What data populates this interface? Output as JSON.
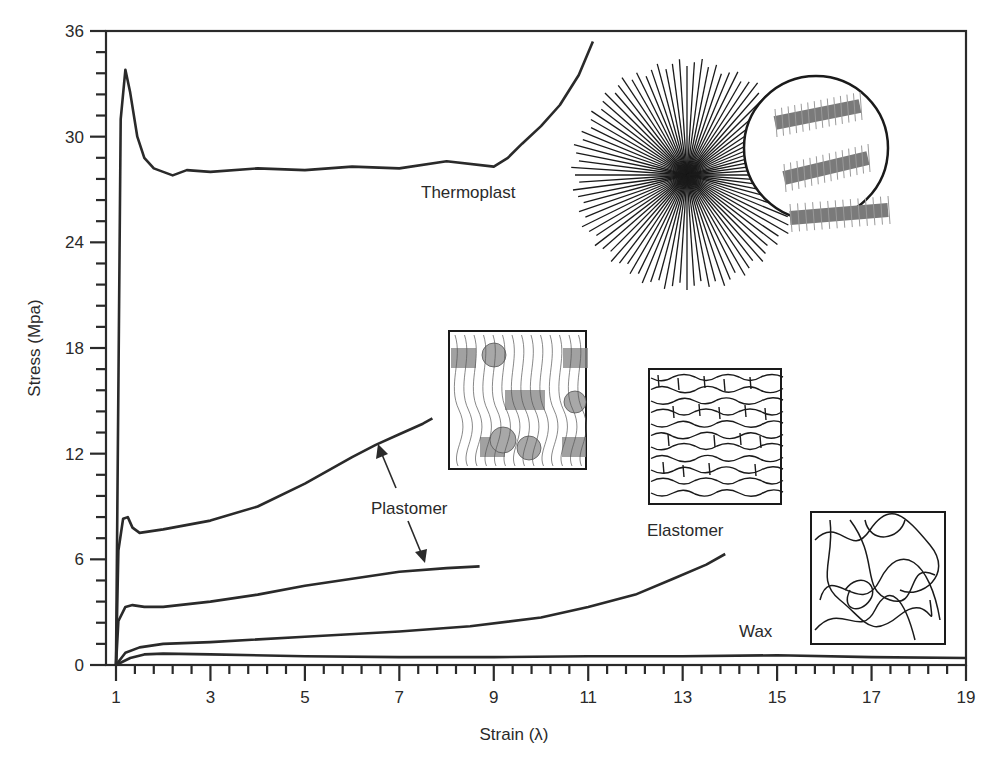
{
  "chart_data": {
    "type": "line",
    "title": "",
    "xlabel": "Strain (λ)",
    "ylabel": "Stress (Mpa)",
    "xlim": [
      1,
      19
    ],
    "ylim": [
      0,
      36
    ],
    "x_ticks": [
      1,
      3,
      5,
      7,
      9,
      11,
      13,
      15,
      17,
      19
    ],
    "y_ticks": [
      0,
      6,
      12,
      18,
      24,
      30,
      36
    ],
    "grid": false,
    "legend": "none (curves labeled by inline annotations)",
    "series": [
      {
        "name": "Thermoplast",
        "x": [
          1.0,
          1.1,
          1.2,
          1.3,
          1.45,
          1.6,
          1.8,
          2.0,
          2.2,
          2.5,
          3.0,
          4.0,
          5.0,
          6.0,
          7.0,
          8.0,
          9.0,
          9.3,
          9.6,
          10.0,
          10.4,
          10.8,
          11.1
        ],
        "y": [
          0,
          31.0,
          33.8,
          32.5,
          30.0,
          28.8,
          28.2,
          28.0,
          27.8,
          28.1,
          28.0,
          28.2,
          28.1,
          28.3,
          28.2,
          28.6,
          28.3,
          28.8,
          29.6,
          30.6,
          31.8,
          33.5,
          35.4
        ]
      },
      {
        "name": "Plastomer (upper)",
        "x": [
          1.0,
          1.05,
          1.15,
          1.25,
          1.35,
          1.5,
          2.0,
          3.0,
          4.0,
          5.0,
          6.0,
          6.5,
          7.0,
          7.5,
          7.7
        ],
        "y": [
          0,
          6.5,
          8.3,
          8.4,
          7.8,
          7.5,
          7.7,
          8.2,
          9.0,
          10.3,
          11.8,
          12.5,
          13.1,
          13.7,
          14.0
        ],
        "annotation": "Plastomer"
      },
      {
        "name": "Plastomer (lower)",
        "x": [
          1.0,
          1.05,
          1.2,
          1.35,
          1.6,
          2.0,
          3.0,
          4.0,
          5.0,
          6.0,
          7.0,
          8.0,
          8.7
        ],
        "y": [
          0,
          2.5,
          3.3,
          3.4,
          3.3,
          3.3,
          3.6,
          4.0,
          4.5,
          4.9,
          5.3,
          5.5,
          5.6
        ],
        "annotation": "Plastomer"
      },
      {
        "name": "Elastomer",
        "x": [
          1.0,
          1.2,
          1.5,
          2.0,
          3.0,
          5.0,
          7.0,
          8.5,
          10.0,
          11.0,
          12.0,
          12.8,
          13.5,
          13.9
        ],
        "y": [
          0,
          0.7,
          1.0,
          1.2,
          1.3,
          1.6,
          1.9,
          2.2,
          2.7,
          3.3,
          4.0,
          4.9,
          5.7,
          6.3
        ]
      },
      {
        "name": "Wax",
        "x": [
          1.0,
          1.3,
          1.6,
          2.0,
          3.0,
          5.0,
          7.0,
          9.0,
          11.0,
          13.0,
          15.0,
          17.0,
          19.0
        ],
        "y": [
          0,
          0.4,
          0.6,
          0.65,
          0.6,
          0.5,
          0.45,
          0.45,
          0.5,
          0.5,
          0.55,
          0.45,
          0.4
        ]
      }
    ],
    "annotations": [
      {
        "text": "Thermoplast",
        "x": 7.6,
        "y": 26.8
      },
      {
        "text": "Plastomer",
        "x": 6.2,
        "y": 9.0,
        "arrows_to": [
          "Plastomer (upper) at λ≈6.4",
          "Plastomer (lower) at λ≈7.9"
        ]
      },
      {
        "text": "Elastomer",
        "x": 12.3,
        "y": 7.7
      },
      {
        "text": "Wax",
        "x": 14.3,
        "y": 1.8
      }
    ],
    "insets": [
      {
        "name": "thermoplast-spherulite",
        "description": "radial spherulite of straight lines with magnified circle showing stacked lamellae"
      },
      {
        "name": "plastomer-morphology",
        "description": "square inset with fringed-micelle crystallites and folded chains"
      },
      {
        "name": "elastomer-network",
        "description": "square inset with crosslinked network of chains"
      },
      {
        "name": "wax-coils",
        "description": "square inset with random amorphous coils"
      }
    ]
  },
  "labels": {
    "xlabel": "Strain (λ)",
    "ylabel": "Stress (Mpa)",
    "thermoplast": "Thermoplast",
    "plastomer": "Plastomer",
    "elastomer": "Elastomer",
    "wax": "Wax",
    "x_ticks": [
      "1",
      "3",
      "5",
      "7",
      "9",
      "11",
      "13",
      "15",
      "17",
      "19"
    ],
    "y_ticks": [
      "0",
      "6",
      "12",
      "18",
      "24",
      "30",
      "36"
    ]
  },
  "colors": {
    "ink": "#2a2a2a",
    "background": "#ffffff",
    "inset_fill": "#888888"
  }
}
